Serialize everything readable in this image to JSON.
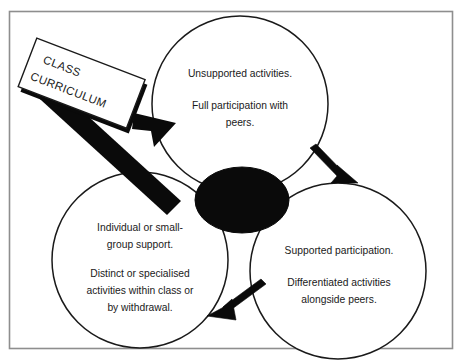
{
  "figure": {
    "frame": {
      "border_color": "#8e8e8e",
      "background": "#ffffff"
    },
    "ink_color": "#0a0a0a",
    "outline_color": "#1a1a1a"
  },
  "curriculum_label": {
    "line1": "CLASS",
    "line2": "CURRICULUM"
  },
  "circles": [
    {
      "id": "unsupported",
      "name": "top-circle",
      "lines": [
        "Unsupported activities.",
        "",
        "Full participation with",
        "peers."
      ]
    },
    {
      "id": "individual-support",
      "name": "bottom-left-circle",
      "lines": [
        "Individual or small-",
        "group support.",
        "",
        "Distinct or specialised",
        "activities within class or",
        "by withdrawal."
      ]
    },
    {
      "id": "supported-participation",
      "name": "bottom-right-circle",
      "lines": [
        "Supported participation.",
        "",
        "Differentiated activities",
        "alongside peers."
      ]
    }
  ],
  "arrows": [
    {
      "id": "curriculum-to-top",
      "style": "thick-block",
      "direction": "up-right"
    },
    {
      "id": "top-to-bottom-right",
      "style": "thin-block",
      "direction": "down-right"
    },
    {
      "id": "bottom-right-to-bottom-left",
      "style": "thin-block",
      "direction": "down-left"
    }
  ]
}
